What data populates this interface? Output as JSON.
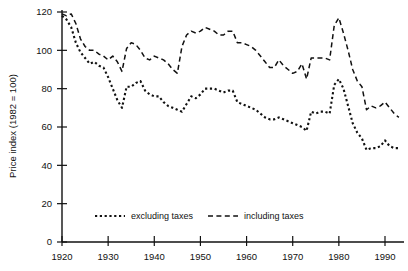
{
  "figure": {
    "name": "price-index-line-chart",
    "background_color": "#ffffff",
    "ink_color": "#111111"
  },
  "chart_data": {
    "type": "line",
    "title": "",
    "subtitle": "",
    "xlabel": "",
    "ylabel": "Price index (1982 = 100)",
    "xlim": [
      1918,
      1994
    ],
    "ylim": [
      0,
      124
    ],
    "grid": false,
    "legend_position": "inside-bottom-center",
    "yticks": [
      0,
      20,
      40,
      60,
      80,
      100,
      120
    ],
    "ytick_labels": [
      "0",
      "20",
      "40",
      "60",
      "80",
      "100",
      "120"
    ],
    "xticks": [
      1920,
      1930,
      1940,
      1950,
      1960,
      1970,
      1980,
      1990
    ],
    "xtick_labels": [
      "1920",
      "1930",
      "1940",
      "1950",
      "1960",
      "1970",
      "1980",
      "1990"
    ],
    "x": [
      1920,
      1921,
      1922,
      1923,
      1924,
      1925,
      1926,
      1927,
      1928,
      1929,
      1930,
      1931,
      1932,
      1933,
      1934,
      1935,
      1936,
      1937,
      1938,
      1939,
      1940,
      1941,
      1942,
      1943,
      1944,
      1945,
      1946,
      1947,
      1948,
      1949,
      1950,
      1951,
      1952,
      1953,
      1954,
      1955,
      1956,
      1957,
      1958,
      1959,
      1960,
      1961,
      1962,
      1963,
      1964,
      1965,
      1966,
      1967,
      1968,
      1969,
      1970,
      1971,
      1972,
      1973,
      1974,
      1975,
      1976,
      1977,
      1978,
      1979,
      1980,
      1981,
      1982,
      1983,
      1984,
      1985,
      1986,
      1987,
      1988,
      1989,
      1990,
      1991,
      1992,
      1993
    ],
    "series": [
      {
        "name": "excluding taxes",
        "label": "excluding taxes",
        "line_style": "dotted",
        "color": "#111111",
        "values": [
          118,
          116,
          112,
          104,
          99,
          96,
          93,
          94,
          92,
          91,
          86,
          80,
          74,
          70,
          81,
          81,
          83,
          84,
          79,
          77,
          76,
          76,
          73,
          71,
          70,
          69,
          68,
          72,
          76,
          75,
          77,
          80,
          80,
          80,
          79,
          78,
          79,
          79,
          73,
          72,
          71,
          70,
          69,
          67,
          65,
          64,
          64,
          65,
          64,
          63,
          62,
          61,
          60,
          58,
          68,
          67,
          68,
          68,
          67,
          82,
          85,
          80,
          71,
          62,
          57,
          54,
          48,
          49,
          49,
          50,
          53,
          50,
          49,
          49
        ]
      },
      {
        "name": "including taxes",
        "label": "including taxes",
        "line_style": "dashed",
        "color": "#111111",
        "values": [
          119,
          118,
          119,
          114,
          106,
          102,
          100,
          100,
          98,
          97,
          95,
          97,
          94,
          89,
          101,
          104,
          103,
          100,
          96,
          95,
          97,
          96,
          95,
          93,
          90,
          88,
          102,
          108,
          110,
          109,
          110,
          112,
          111,
          110,
          108,
          108,
          110,
          110,
          104,
          104,
          103,
          102,
          100,
          97,
          94,
          91,
          91,
          95,
          92,
          90,
          88,
          89,
          93,
          85,
          96,
          96,
          96,
          96,
          95,
          113,
          117,
          109,
          100,
          90,
          84,
          81,
          69,
          71,
          70,
          71,
          73,
          70,
          67,
          65
        ]
      }
    ]
  },
  "legend": {
    "entries": [
      {
        "label": "excluding taxes",
        "style": "dotted"
      },
      {
        "label": "including taxes",
        "style": "dashed"
      }
    ]
  }
}
